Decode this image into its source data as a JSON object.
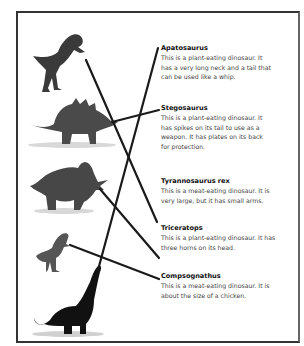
{
  "diagram": {
    "type": "matching-exercise",
    "entries": [
      {
        "name": "Apatosaurus",
        "lines": [
          "This is a plant-eating dinosaur. It",
          "has a very long neck and a tail that",
          "can be used like a whip."
        ]
      },
      {
        "name": "Stegosaurus",
        "lines": [
          "This is a plant-eating dinosaur. It",
          "has spikes on its tail to use as a",
          "weapon. It has plates on its back",
          "for protection."
        ]
      },
      {
        "name": "Tyrannosaurus rex",
        "lines": [
          "This is a meat-eating dinosaur. It is",
          "very large, but it has small arms."
        ]
      },
      {
        "name": "Triceratops",
        "lines": [
          "This is a plant-eating dinosaur. It has",
          "three horns on its head."
        ]
      },
      {
        "name": "Compsognathus",
        "lines": [
          "This is a meat-eating dinosaur. It is",
          "about the size of a chicken."
        ]
      }
    ],
    "images": [
      "tyrannosaurus-image",
      "stegosaurus-image",
      "triceratops-image",
      "compsognathus-image",
      "apatosaurus-image"
    ],
    "connections": [
      {
        "from": "tyrannosaurus-image",
        "to": "Tyrannosaurus rex"
      },
      {
        "from": "stegosaurus-image",
        "to": "Stegosaurus"
      },
      {
        "from": "triceratops-image",
        "to": "Triceratops"
      },
      {
        "from": "compsognathus-image",
        "to": "Compsognathus"
      },
      {
        "from": "apatosaurus-image",
        "to": "Apatosaurus"
      }
    ],
    "colors": {
      "line": "#1a1a1a",
      "frame": "#333333",
      "text": "#444444"
    }
  }
}
